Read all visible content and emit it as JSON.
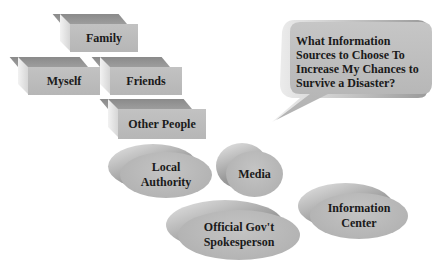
{
  "diagram": {
    "title_bubble": {
      "lines": [
        "What Information",
        "Sources to Choose To",
        "Increase My Chances to",
        "Survive a Disaster?"
      ]
    },
    "personal_sources": [
      {
        "label": "Family"
      },
      {
        "label": "Myself"
      },
      {
        "label": "Friends"
      },
      {
        "label": "Other People"
      }
    ],
    "official_sources": [
      {
        "label_lines": [
          "Local",
          "Authority"
        ]
      },
      {
        "label_lines": [
          "Media"
        ]
      },
      {
        "label_lines": [
          "Official Gov't",
          "Spokesperson"
        ]
      },
      {
        "label_lines": [
          "Information",
          "Center"
        ]
      }
    ],
    "colors": {
      "block_front": "#bdbdbd",
      "block_top": "#939393",
      "disc_face": "#b8b8b8",
      "bubble_fill": "#bababa"
    }
  }
}
